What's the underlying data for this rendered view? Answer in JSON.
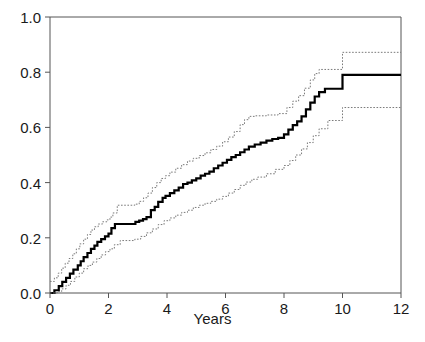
{
  "chart_data": {
    "type": "line",
    "title": "",
    "subtitle": "",
    "xlabel": "Years",
    "ylabel": "",
    "xlim": [
      0,
      12
    ],
    "ylim": [
      0,
      1
    ],
    "xticks": [
      0,
      2,
      4,
      6,
      8,
      10,
      12
    ],
    "xtick_labels": [
      "0",
      "2",
      "4",
      "6",
      "8",
      "10",
      "12"
    ],
    "yticks": [
      0.0,
      0.2,
      0.4,
      0.6,
      0.8,
      1.0
    ],
    "ytick_labels": [
      "0.0",
      "0.2",
      "0.4",
      "0.6",
      "0.8",
      "1.0"
    ],
    "grid": false,
    "legend": null,
    "step_style": "post",
    "series": [
      {
        "name": "Cumulative incidence estimate",
        "role": "estimate",
        "style": "solid",
        "color": "#000000",
        "width": 2.2,
        "x": [
          0.0,
          0.15,
          0.3,
          0.42,
          0.55,
          0.68,
          0.8,
          0.95,
          1.05,
          1.15,
          1.28,
          1.4,
          1.52,
          1.62,
          1.75,
          1.88,
          2.0,
          2.1,
          2.22,
          2.8,
          2.92,
          3.05,
          3.18,
          3.3,
          3.45,
          3.58,
          3.7,
          3.85,
          3.95,
          4.1,
          4.25,
          4.4,
          4.55,
          4.7,
          4.85,
          5.0,
          5.15,
          5.3,
          5.45,
          5.6,
          5.75,
          5.9,
          6.05,
          6.2,
          6.35,
          6.5,
          6.65,
          6.8,
          7.0,
          7.2,
          7.4,
          7.6,
          7.8,
          8.0,
          8.15,
          8.3,
          8.45,
          8.6,
          8.75,
          8.9,
          9.05,
          9.2,
          9.4,
          10.0,
          12.0
        ],
        "y": [
          0.0,
          0.01,
          0.025,
          0.04,
          0.055,
          0.07,
          0.085,
          0.1,
          0.115,
          0.13,
          0.145,
          0.16,
          0.172,
          0.185,
          0.195,
          0.205,
          0.215,
          0.235,
          0.25,
          0.25,
          0.258,
          0.262,
          0.268,
          0.275,
          0.3,
          0.312,
          0.33,
          0.345,
          0.352,
          0.362,
          0.372,
          0.382,
          0.395,
          0.4,
          0.408,
          0.415,
          0.425,
          0.432,
          0.44,
          0.452,
          0.462,
          0.472,
          0.482,
          0.492,
          0.5,
          0.51,
          0.52,
          0.53,
          0.538,
          0.545,
          0.552,
          0.558,
          0.562,
          0.575,
          0.592,
          0.608,
          0.622,
          0.64,
          0.665,
          0.69,
          0.712,
          0.728,
          0.74,
          0.79,
          0.79
        ]
      },
      {
        "name": "Upper 95% confidence limit",
        "role": "upper-ci",
        "style": "dotted",
        "color": "#7a7a7a",
        "width": 1.0,
        "x": [
          0.0,
          0.08,
          0.15,
          0.28,
          0.4,
          0.52,
          0.65,
          0.78,
          0.9,
          1.02,
          1.15,
          1.28,
          1.4,
          1.52,
          1.65,
          1.8,
          1.95,
          2.05,
          2.15,
          2.3,
          2.9,
          3.05,
          3.2,
          3.35,
          3.5,
          3.65,
          3.8,
          3.95,
          4.1,
          4.3,
          4.5,
          4.7,
          4.9,
          5.1,
          5.3,
          5.5,
          5.7,
          5.9,
          6.1,
          6.3,
          6.5,
          6.65,
          6.8,
          7.0,
          7.4,
          7.8,
          8.1,
          8.3,
          8.5,
          8.7,
          8.9,
          9.05,
          9.2,
          10.0,
          12.0
        ],
        "y": [
          0.042,
          0.042,
          0.055,
          0.072,
          0.09,
          0.108,
          0.125,
          0.142,
          0.16,
          0.178,
          0.195,
          0.212,
          0.228,
          0.24,
          0.25,
          0.258,
          0.265,
          0.275,
          0.29,
          0.318,
          0.322,
          0.332,
          0.345,
          0.362,
          0.382,
          0.4,
          0.415,
          0.425,
          0.438,
          0.452,
          0.465,
          0.478,
          0.488,
          0.498,
          0.508,
          0.52,
          0.532,
          0.548,
          0.565,
          0.585,
          0.61,
          0.628,
          0.64,
          0.642,
          0.645,
          0.65,
          0.672,
          0.695,
          0.715,
          0.742,
          0.772,
          0.795,
          0.81,
          0.872,
          0.872
        ]
      },
      {
        "name": "Lower 95% confidence limit",
        "role": "lower-ci",
        "style": "dotted",
        "color": "#7a7a7a",
        "width": 1.0,
        "x": [
          0.0,
          0.25,
          0.4,
          0.55,
          0.7,
          0.85,
          1.0,
          1.15,
          1.3,
          1.45,
          1.6,
          1.75,
          1.9,
          2.05,
          2.2,
          2.4,
          2.9,
          3.1,
          3.3,
          3.5,
          3.7,
          3.9,
          4.1,
          4.3,
          4.5,
          4.7,
          4.9,
          5.1,
          5.3,
          5.5,
          5.7,
          5.9,
          6.1,
          6.3,
          6.5,
          6.7,
          6.9,
          7.1,
          7.4,
          7.7,
          8.0,
          8.2,
          8.4,
          8.6,
          8.8,
          9.0,
          9.2,
          9.5,
          10.0,
          12.0
        ],
        "y": [
          0.0,
          0.005,
          0.015,
          0.028,
          0.042,
          0.058,
          0.072,
          0.088,
          0.1,
          0.112,
          0.125,
          0.138,
          0.15,
          0.16,
          0.175,
          0.19,
          0.195,
          0.205,
          0.218,
          0.232,
          0.248,
          0.262,
          0.272,
          0.282,
          0.292,
          0.3,
          0.31,
          0.318,
          0.325,
          0.332,
          0.34,
          0.35,
          0.362,
          0.375,
          0.39,
          0.402,
          0.412,
          0.42,
          0.432,
          0.448,
          0.462,
          0.48,
          0.5,
          0.522,
          0.545,
          0.57,
          0.595,
          0.625,
          0.672,
          0.672
        ]
      }
    ]
  },
  "axes": {
    "frame_color": "#555555",
    "tick_color": "#555555"
  }
}
